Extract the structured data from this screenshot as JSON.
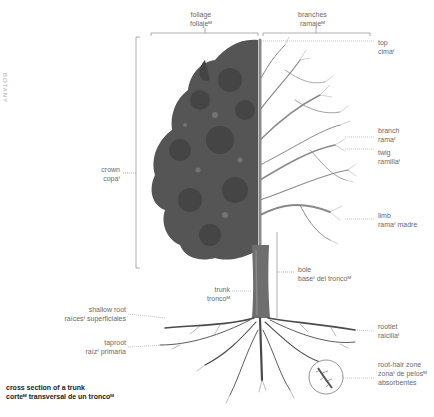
{
  "side_label": "BOTANY",
  "top_labels": {
    "foliage": {
      "en": "foliage",
      "es": "follajeᴹ"
    },
    "branches": {
      "en": "branches",
      "es": "ramajeᴹ"
    }
  },
  "labels": {
    "top": {
      "en": "top",
      "es": "cimaᶠ"
    },
    "branch": {
      "en": "branch",
      "es": "ramaᶠ"
    },
    "twig": {
      "en": "twig",
      "es": "ramillaᶠ"
    },
    "limb": {
      "en": "limb",
      "es": "ramaᶠ madre"
    },
    "crown": {
      "en": "crown",
      "es": "copaᶠ"
    },
    "bole": {
      "en": "bole",
      "es": "baseᶠ del troncoᴹ"
    },
    "trunk": {
      "en": "trunk",
      "es": "troncoᴹ"
    },
    "shallow_root": {
      "en": "shallow root",
      "es": "raícesᶠ superficiales"
    },
    "taproot": {
      "en": "taproot",
      "es": "raízᶠ primaria"
    },
    "rootlet": {
      "en": "rootlet",
      "es": "raicillaᶠ"
    },
    "root_hair_zone": {
      "en": "root-hair zone",
      "es1": "zonaᶠ de pelosᴹ",
      "es2": "absorbentes"
    }
  },
  "footer": {
    "en": "cross section of a trunk",
    "es": "corteᴹ transversal de un troncoᴹ"
  },
  "colors": {
    "line": "#9a9a9a",
    "foliage": "#555555",
    "branches": "#8a8a8a",
    "trunk": "#6e6e6e",
    "roots": "#4a4a4a"
  }
}
